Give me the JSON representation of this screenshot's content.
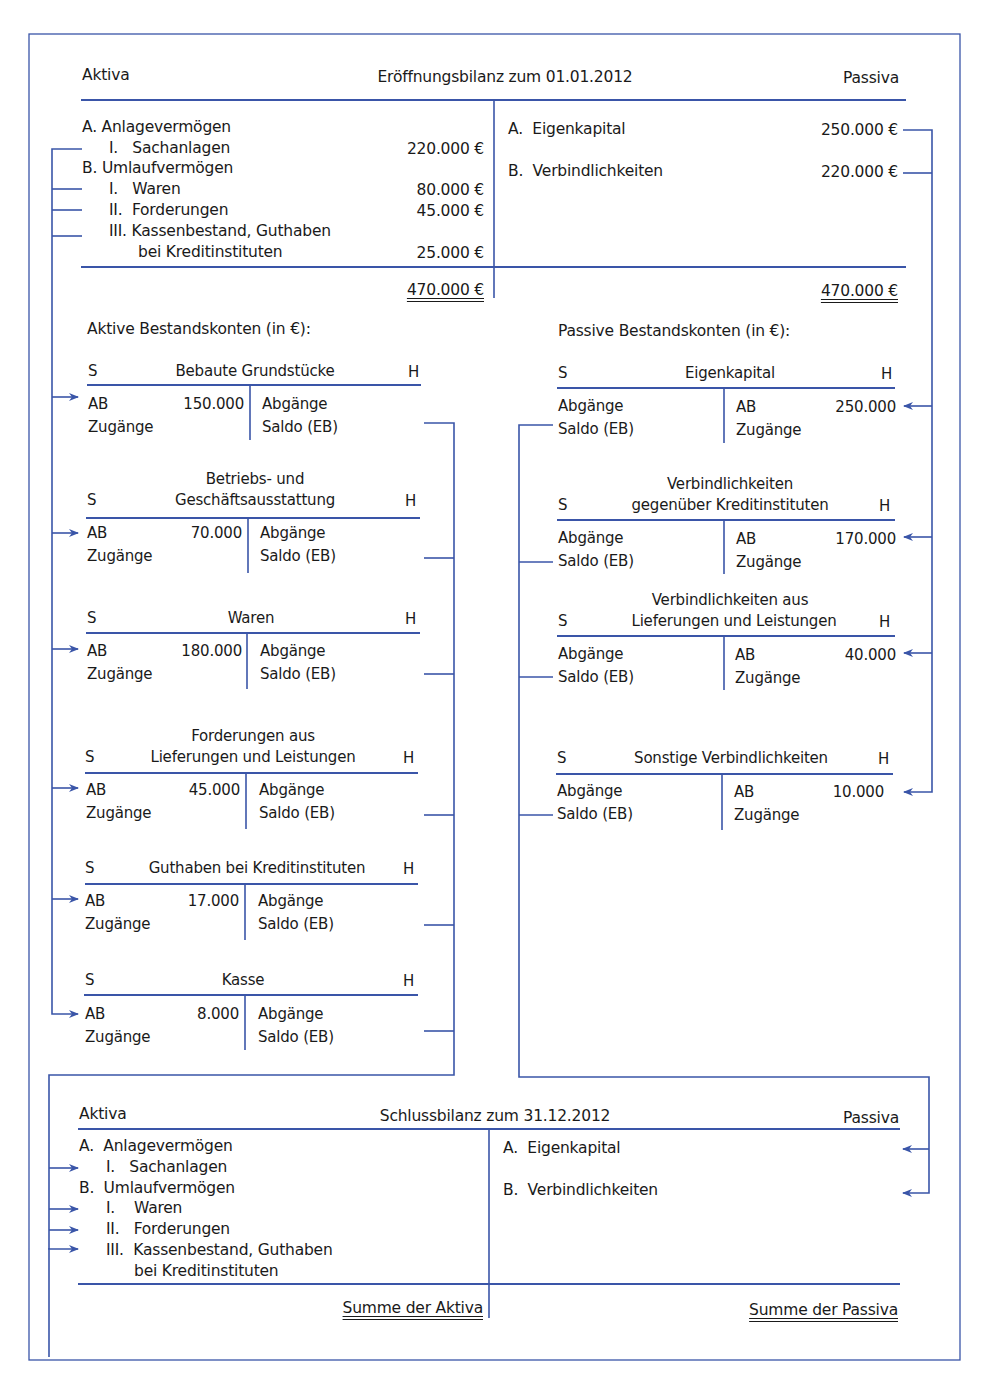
{
  "colors": {
    "line": "#3a55a8",
    "text": "#1a1a1a"
  },
  "opening_balance": {
    "left_header": "Aktiva",
    "title": "Eröffnungsbilanz zum 01.01.2012",
    "right_header": "Passiva",
    "aktiva": [
      {
        "label": "A.  Anlagevermögen",
        "value": ""
      },
      {
        "label": "I.   Sachanlagen",
        "value": "220.000 €"
      },
      {
        "label": "B.  Umlaufvermögen",
        "value": ""
      },
      {
        "label": "I.   Waren",
        "value": "80.000 €"
      },
      {
        "label": "II.  Forderungen",
        "value": "45.000 €"
      },
      {
        "label": "III. Kassenbestand, Guthaben",
        "value": ""
      },
      {
        "label": "bei Kreditinstituten",
        "value": "25.000 €"
      }
    ],
    "passiva": [
      {
        "label": "A.  Eigenkapital",
        "value": "250.000 €"
      },
      {
        "label": "B.  Verbindlichkeiten",
        "value": "220.000 €"
      }
    ],
    "total_aktiva": "470.000 €",
    "total_passiva": "470.000 €"
  },
  "active_accounts": {
    "heading": "Aktive Bestandskonten (in €):",
    "accounts": [
      {
        "title_line1": "",
        "title": "Bebaute Grundstücke",
        "debit_label": "S",
        "credit_label": "H",
        "ab_label": "AB",
        "ab_value": "150.000",
        "zugaenge": "Zugänge",
        "abgaenge": "Abgänge",
        "saldo": "Saldo (EB)"
      },
      {
        "title_line1": "Betriebs- und",
        "title": "Geschäftsausstattung",
        "debit_label": "S",
        "credit_label": "H",
        "ab_label": "AB",
        "ab_value": "70.000",
        "zugaenge": "Zugänge",
        "abgaenge": "Abgänge",
        "saldo": "Saldo (EB)"
      },
      {
        "title_line1": "",
        "title": "Waren",
        "debit_label": "S",
        "credit_label": "H",
        "ab_label": "AB",
        "ab_value": "180.000",
        "zugaenge": "Zugänge",
        "abgaenge": "Abgänge",
        "saldo": "Saldo (EB)"
      },
      {
        "title_line1": "Forderungen aus",
        "title": "Lieferungen und Leistungen",
        "debit_label": "S",
        "credit_label": "H",
        "ab_label": "AB",
        "ab_value": "45.000",
        "zugaenge": "Zugänge",
        "abgaenge": "Abgänge",
        "saldo": "Saldo (EB)"
      },
      {
        "title_line1": "",
        "title": "Guthaben bei Kreditinstituten",
        "debit_label": "S",
        "credit_label": "H",
        "ab_label": "AB",
        "ab_value": "17.000",
        "zugaenge": "Zugänge",
        "abgaenge": "Abgänge",
        "saldo": "Saldo (EB)"
      },
      {
        "title_line1": "",
        "title": "Kasse",
        "debit_label": "S",
        "credit_label": "H",
        "ab_label": "AB",
        "ab_value": "8.000",
        "zugaenge": "Zugänge",
        "abgaenge": "Abgänge",
        "saldo": "Saldo (EB)"
      }
    ]
  },
  "passive_accounts": {
    "heading": "Passive Bestandskonten (in €):",
    "accounts": [
      {
        "title_line1": "",
        "title": "Eigenkapital",
        "debit_label": "S",
        "credit_label": "H",
        "ab_label": "AB",
        "ab_value": "250.000",
        "zugaenge": "Zugänge",
        "abgaenge": "Abgänge",
        "saldo": "Saldo (EB)"
      },
      {
        "title_line1": "Verbindlichkeiten",
        "title": "gegenüber Kreditinstituten",
        "debit_label": "S",
        "credit_label": "H",
        "ab_label": "AB",
        "ab_value": "170.000",
        "zugaenge": "Zugänge",
        "abgaenge": "Abgänge",
        "saldo": "Saldo (EB)"
      },
      {
        "title_line1": "Verbindlichkeiten aus",
        "title": "Lieferungen und Leistungen",
        "debit_label": "S",
        "credit_label": "H",
        "ab_label": "AB",
        "ab_value": "40.000",
        "zugaenge": "Zugänge",
        "abgaenge": "Abgänge",
        "saldo": "Saldo (EB)"
      },
      {
        "title_line1": "",
        "title": "Sonstige Verbindlichkeiten",
        "debit_label": "S",
        "credit_label": "H",
        "ab_label": "AB",
        "ab_value": "10.000",
        "zugaenge": "Zugänge",
        "abgaenge": "Abgänge",
        "saldo": "Saldo (EB)"
      }
    ]
  },
  "closing_balance": {
    "left_header": "Aktiva",
    "title": "Schlussbilanz zum 31.12.2012",
    "right_header": "Passiva",
    "aktiva": [
      "A.  Anlagevermögen",
      "I.   Sachanlagen",
      "B.  Umlaufvermögen",
      "I.    Waren",
      "II.   Forderungen",
      "III.  Kassenbestand, Guthaben",
      "bei Kreditinstituten"
    ],
    "passiva": [
      "A.  Eigenkapital",
      "B.  Verbindlichkeiten"
    ],
    "total_aktiva": "Summe der Aktiva",
    "total_passiva": "Summe der Passiva"
  }
}
